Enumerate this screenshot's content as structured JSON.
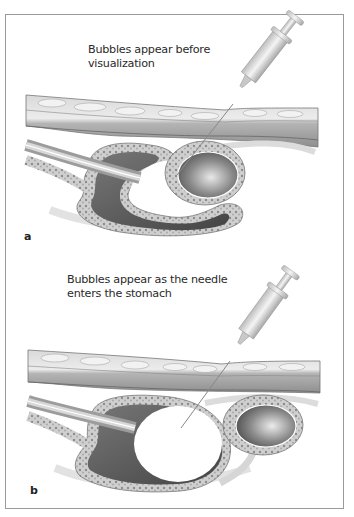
{
  "figure": {
    "panels": [
      {
        "label": "a",
        "caption": "Bubbles appear before visualization",
        "illustration": "syringe-needle-through-abdominal-wall-into-bowel-before-stomach"
      },
      {
        "label": "b",
        "caption": "Bubbles appear as the needle enters the stomach",
        "illustration": "syringe-needle-through-abdominal-wall-into-stomach-lumen"
      }
    ],
    "colors": {
      "border": "#9a9a9a",
      "tissue": "#c8c8c8",
      "lumen_dark": "#5a5a5a",
      "text": "#2a2a2a"
    }
  }
}
